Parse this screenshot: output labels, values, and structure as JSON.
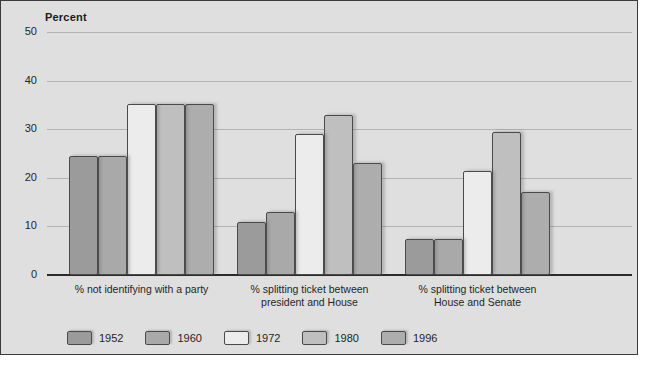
{
  "chart_data": {
    "type": "bar",
    "title": "",
    "ylabel": "Percent",
    "xlabel": "",
    "ylim": [
      0,
      50
    ],
    "yticks": [
      0,
      10,
      20,
      30,
      40,
      50
    ],
    "grid": true,
    "legend_position": "bottom-left",
    "categories": [
      "% not identifying with a party",
      "% splitting ticket between president and House",
      "% splitting ticket between House and Senate"
    ],
    "category_lines": [
      [
        "% not identifying with a party"
      ],
      [
        "% splitting ticket between",
        "president and House"
      ],
      [
        "% splitting ticket between",
        "House and Senate"
      ]
    ],
    "series": [
      {
        "name": "1952",
        "color": "#9b9b9b",
        "values": [
          24.5,
          11.0,
          7.5
        ]
      },
      {
        "name": "1960",
        "color": "#a9a9a9",
        "values": [
          24.5,
          13.0,
          7.5
        ]
      },
      {
        "name": "1972",
        "color": "#ececec",
        "values": [
          35.2,
          29.0,
          21.5
        ]
      },
      {
        "name": "1980",
        "color": "#bfbfbf",
        "values": [
          35.2,
          33.0,
          29.5
        ]
      },
      {
        "name": "1996",
        "color": "#adadad",
        "values": [
          35.2,
          23.0,
          17.0
        ]
      }
    ]
  },
  "legend": {
    "items": [
      {
        "label": "1952",
        "color": "#9b9b9b"
      },
      {
        "label": "1960",
        "color": "#a9a9a9"
      },
      {
        "label": "1972",
        "color": "#ececec"
      },
      {
        "label": "1980",
        "color": "#bfbfbf"
      },
      {
        "label": "1996",
        "color": "#adadad"
      }
    ]
  },
  "colors": {
    "panel_background": "#dfdfdf",
    "panel_border": "#3a3a3a",
    "gridline": "#b3b3b3",
    "axis": "#2b2b2b",
    "bar_outline": "#4a4a4a",
    "text": "#1f1f1f"
  }
}
